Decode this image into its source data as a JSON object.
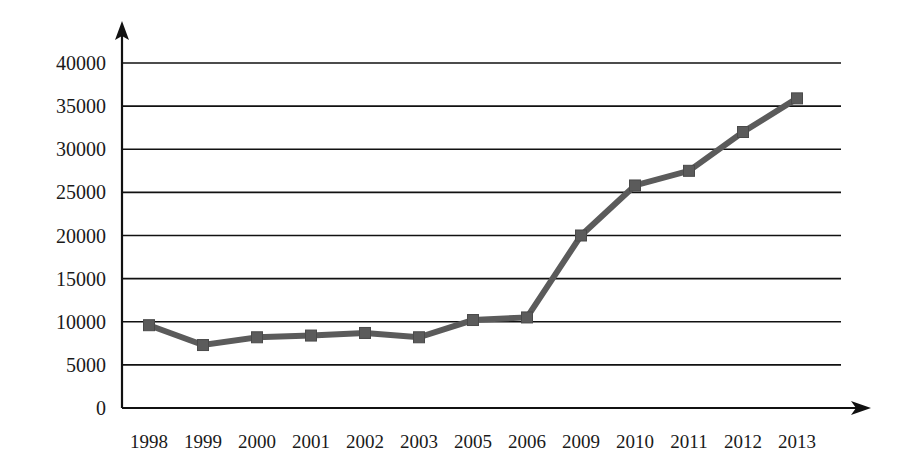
{
  "chart_data": {
    "type": "line",
    "title": "",
    "subtitle": "",
    "xlabel": "",
    "ylabel": "",
    "categories": [
      "1998",
      "1999",
      "2000",
      "2001",
      "2002",
      "2003",
      "2005",
      "2006",
      "2009",
      "2010",
      "2011",
      "2012",
      "2013"
    ],
    "values": [
      9600,
      7300,
      8200,
      8400,
      8700,
      8200,
      10200,
      10500,
      20000,
      25800,
      27500,
      32000,
      35900
    ],
    "series": [
      {
        "name": "series-1",
        "values": [
          9600,
          7300,
          8200,
          8400,
          8700,
          8200,
          10200,
          10500,
          20000,
          25800,
          27500,
          32000,
          35900
        ]
      }
    ],
    "ylim": [
      0,
      40000
    ],
    "ytick_labels": [
      "0",
      "5000",
      "10000",
      "15000",
      "20000",
      "25000",
      "30000",
      "35000",
      "40000"
    ],
    "ytick_values": [
      0,
      5000,
      10000,
      15000,
      20000,
      25000,
      30000,
      35000,
      40000
    ],
    "grid": true,
    "grid_axis": "y",
    "legend": false,
    "legend_position": "none",
    "marker": "square",
    "annotations": [],
    "colors": {
      "series": "#5b5b5b",
      "marker": "#5b5b5b",
      "axis": "#111111",
      "grid": "#111111",
      "background": "#ffffff",
      "text": "#1a1a1a"
    }
  }
}
